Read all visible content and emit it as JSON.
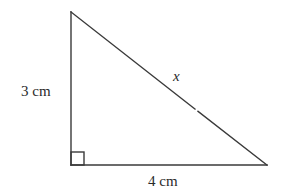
{
  "diagram": {
    "type": "right-triangle",
    "stroke_color": "#3a3a3a",
    "vertices": {
      "top": [
        71,
        12
      ],
      "bottom_left": [
        71,
        165
      ],
      "bottom_right": [
        267,
        165
      ]
    },
    "labels": {
      "vertical_side": "3 cm",
      "horizontal_side": "4 cm",
      "hypotenuse": "x"
    },
    "right_angle_marker": {
      "corner": "bottom_left",
      "size": 13
    }
  }
}
